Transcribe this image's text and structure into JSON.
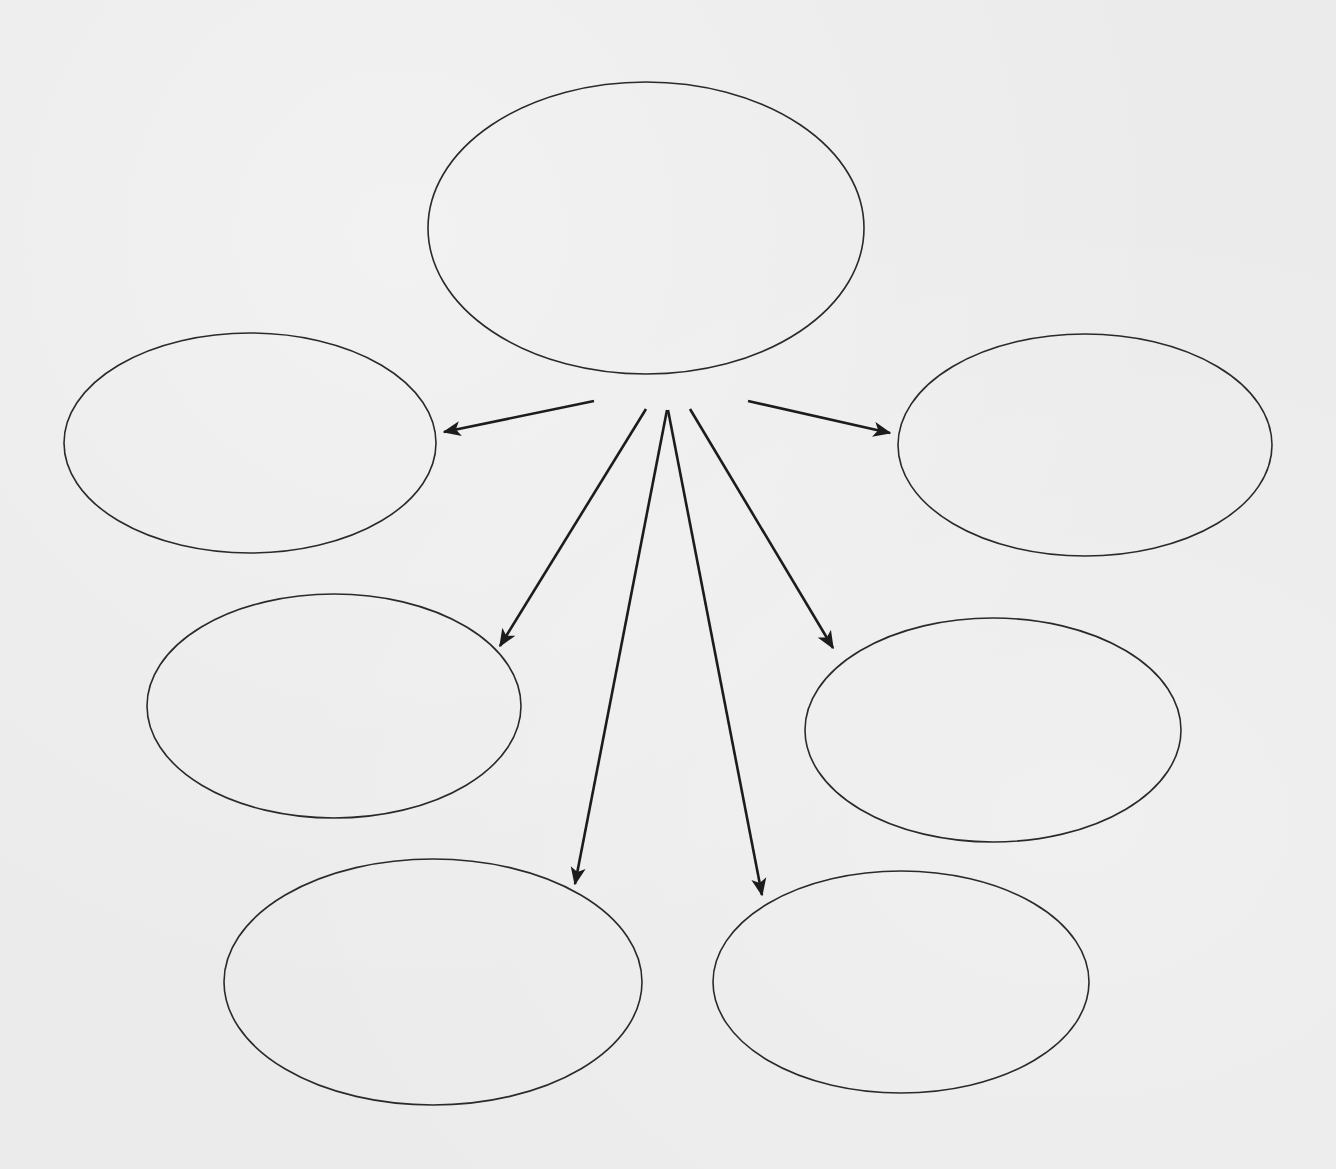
{
  "diagram": {
    "type": "web-organizer",
    "colors": {
      "background": "#ebebeb",
      "stroke": "#2a2a2a",
      "arrow": "#1c1c1c"
    },
    "center": {
      "id": "center",
      "label": "",
      "cx": 646,
      "cy": 228,
      "rx": 218,
      "ry": 146
    },
    "nodes": [
      {
        "id": "upper-left",
        "label": "",
        "cx": 250,
        "cy": 443,
        "rx": 186,
        "ry": 110
      },
      {
        "id": "upper-right",
        "label": "",
        "cx": 1085,
        "cy": 445,
        "rx": 187,
        "ry": 111
      },
      {
        "id": "middle-left",
        "label": "",
        "cx": 334,
        "cy": 706,
        "rx": 187,
        "ry": 112
      },
      {
        "id": "middle-right",
        "label": "",
        "cx": 993,
        "cy": 730,
        "rx": 188,
        "ry": 112
      },
      {
        "id": "lower-left",
        "label": "",
        "cx": 433,
        "cy": 982,
        "rx": 209,
        "ry": 123
      },
      {
        "id": "lower-right",
        "label": "",
        "cx": 901,
        "cy": 982,
        "rx": 188,
        "ry": 111
      }
    ],
    "edges": [
      {
        "from": "center",
        "to": "upper-left",
        "x1": 594,
        "y1": 401,
        "x2": 444,
        "y2": 432
      },
      {
        "from": "center",
        "to": "upper-right",
        "x1": 748,
        "y1": 401,
        "x2": 890,
        "y2": 433
      },
      {
        "from": "center",
        "to": "middle-left",
        "x1": 646,
        "y1": 409,
        "x2": 500,
        "y2": 646
      },
      {
        "from": "center",
        "to": "lower-left",
        "x1": 667,
        "y1": 410,
        "x2": 575,
        "y2": 884
      },
      {
        "from": "center",
        "to": "lower-right",
        "x1": 668,
        "y1": 410,
        "x2": 762,
        "y2": 895
      },
      {
        "from": "center",
        "to": "middle-right",
        "x1": 690,
        "y1": 409,
        "x2": 833,
        "y2": 648
      }
    ]
  }
}
